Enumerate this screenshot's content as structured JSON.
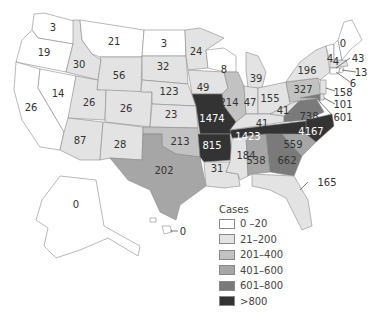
{
  "legend": {
    "title": "Cases",
    "bins": [
      {
        "label": "0 –20",
        "color": "#ffffff"
      },
      {
        "label": "21–200",
        "color": "#e3e3e3"
      },
      {
        "label": "201–400",
        "color": "#c2c2c2"
      },
      {
        "label": "401–600",
        "color": "#a6a6a6"
      },
      {
        "label": "601–800",
        "color": "#7a7a7a"
      },
      {
        "label": ">800",
        "color": "#333333"
      }
    ]
  },
  "states": {
    "WA": "3",
    "OR": "19",
    "CA": "26",
    "NV": "14",
    "ID": "30",
    "MT": "21",
    "WY": "56",
    "UT": "26",
    "AZ": "87",
    "CO": "26",
    "NM": "28",
    "ND": "3",
    "SD": "32",
    "NE": "123",
    "KS": "23",
    "OK": "213",
    "TX": "202",
    "MN": "24",
    "IA": "49",
    "MO": "1474",
    "AR": "815",
    "LA": "31",
    "WI": "8",
    "IL": "214",
    "MI": "39",
    "IN": "47",
    "OH": "155",
    "KY": "41",
    "TN": "1423",
    "MS": "184",
    "AL": "538",
    "GA": "662",
    "FL": "165",
    "SC": "559",
    "NC": "4167",
    "VA": "738",
    "WV": "41",
    "PA": "327",
    "NY": "196",
    "VT": "4",
    "NH": "4",
    "ME": "0",
    "MA": "43",
    "RI": "13",
    "CT": "6",
    "NJ": "158",
    "DE": "101",
    "MD": "601",
    "AK": "0",
    "HI": "0"
  }
}
